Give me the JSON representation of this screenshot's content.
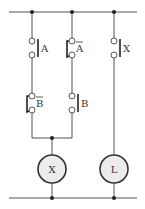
{
  "diagram": {
    "type": "ladder-relay-circuit",
    "colors": {
      "wire": "#555555",
      "contact_bar": "#222222",
      "coil_fill": "#ececec",
      "coil_stroke": "#333333"
    },
    "contacts": [
      {
        "id": "A",
        "label": "A",
        "type": "normally-open"
      },
      {
        "id": "A_bar",
        "label": "A",
        "negated": true,
        "type": "normally-closed"
      },
      {
        "id": "X",
        "label": "X",
        "type": "normally-open"
      },
      {
        "id": "B_bar",
        "label": "B",
        "negated": true,
        "type": "normally-closed"
      },
      {
        "id": "B",
        "label": "B",
        "type": "normally-open"
      }
    ],
    "coils": [
      {
        "id": "X",
        "label": "X"
      },
      {
        "id": "L",
        "label": "L"
      }
    ]
  }
}
